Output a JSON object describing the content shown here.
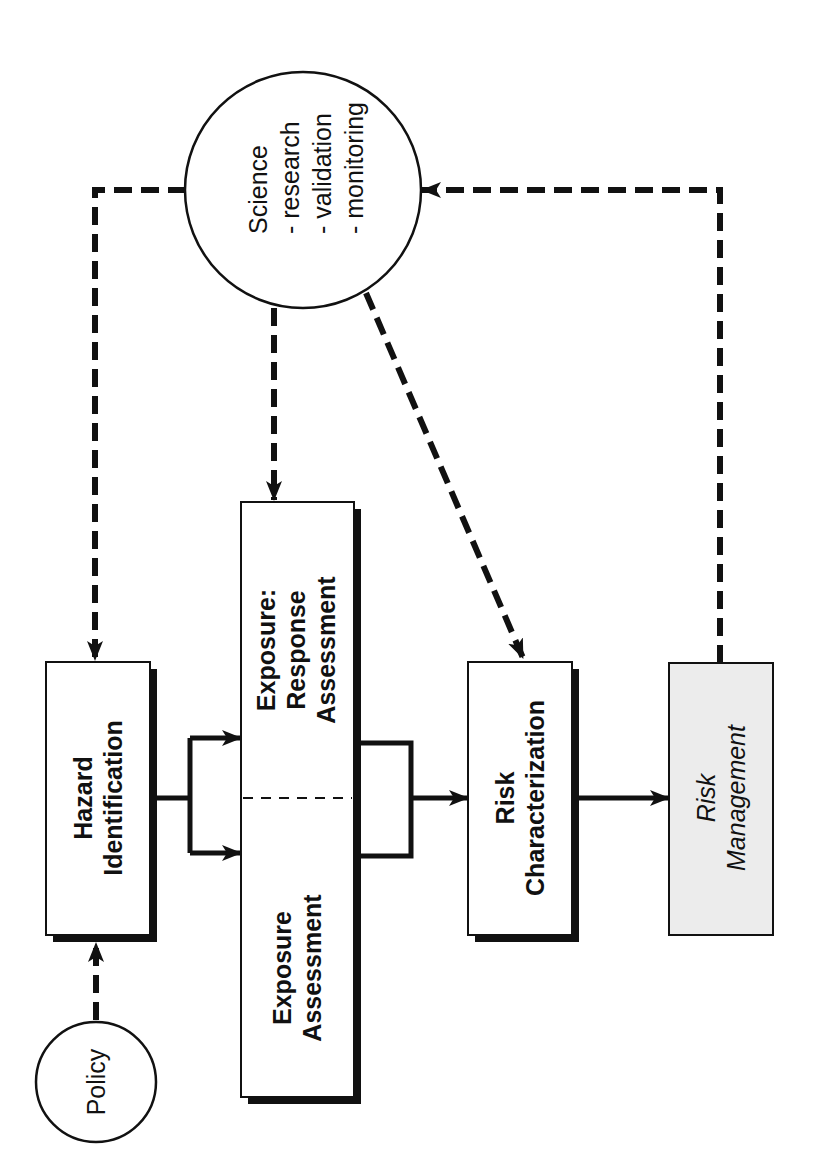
{
  "diagram": {
    "orientation": "rotated-90-ccw",
    "colors": {
      "ink": "#111111",
      "background": "#ffffff",
      "management_fill": "#ececec"
    },
    "nodes": {
      "policy": {
        "label": "Policy",
        "shape": "circle"
      },
      "science": {
        "label": "Science",
        "items": [
          "- research",
          "- validation",
          "- monitoring"
        ],
        "shape": "circle"
      },
      "hazard": {
        "line1": "Hazard",
        "line2": "Identification",
        "shape": "box"
      },
      "exposure_response": {
        "line1": "Exposure:",
        "line2": "Response",
        "line3": "Assessment",
        "shape": "box"
      },
      "exposure": {
        "line1": "Exposure",
        "line2": "Assessment",
        "shape": "box"
      },
      "risk_char": {
        "line1": "Risk",
        "line2": "Characterization",
        "shape": "box"
      },
      "risk_mgmt": {
        "line1": "Risk",
        "line2": "Management",
        "shape": "box",
        "style": "italic, shaded"
      }
    },
    "edges": [
      {
        "from": "policy",
        "to": "hazard",
        "style": "dashed"
      },
      {
        "from": "science",
        "to": "hazard",
        "style": "dashed"
      },
      {
        "from": "science",
        "to": "exposure_response",
        "style": "dashed"
      },
      {
        "from": "science",
        "to": "risk_char",
        "style": "dashed"
      },
      {
        "from": "risk_mgmt",
        "to": "science",
        "style": "dashed"
      },
      {
        "from": "hazard",
        "to": "exposure_response",
        "style": "solid"
      },
      {
        "from": "hazard",
        "to": "exposure",
        "style": "solid"
      },
      {
        "from": "exposure_response",
        "to": "risk_char",
        "style": "solid"
      },
      {
        "from": "exposure",
        "to": "risk_char",
        "style": "solid"
      },
      {
        "from": "risk_char",
        "to": "risk_mgmt",
        "style": "solid"
      }
    ]
  }
}
